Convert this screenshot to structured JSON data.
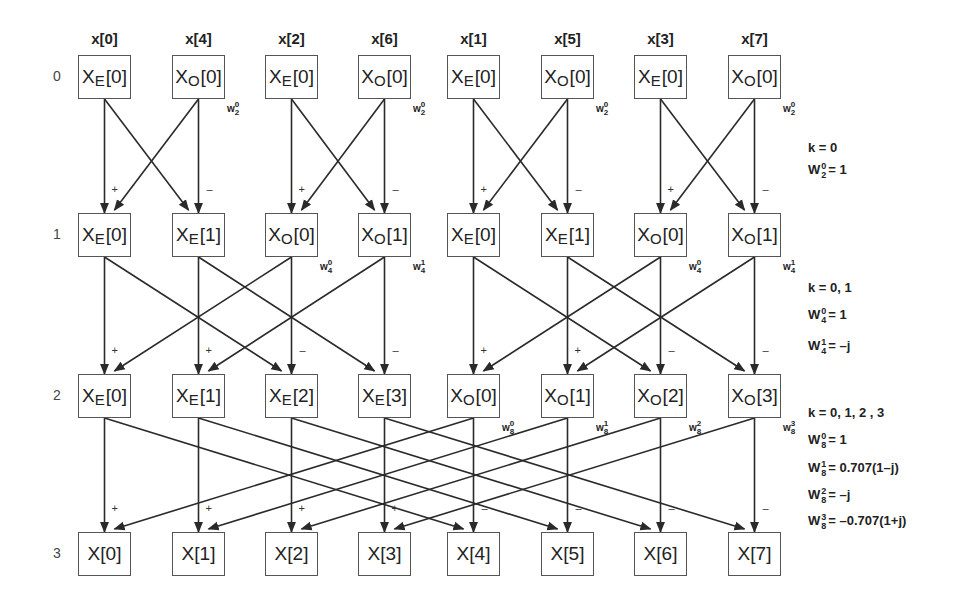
{
  "diagram": {
    "inputs": [
      "x[0]",
      "x[4]",
      "x[2]",
      "x[6]",
      "x[1]",
      "x[5]",
      "x[3]",
      "x[7]"
    ],
    "stages": [
      "0",
      "1",
      "2",
      "3"
    ],
    "rows": [
      [
        {
          "base": "X",
          "sub": "E",
          "idx": "[0]"
        },
        {
          "base": "X",
          "sub": "O",
          "idx": "[0]"
        },
        {
          "base": "X",
          "sub": "E",
          "idx": "[0]"
        },
        {
          "base": "X",
          "sub": "O",
          "idx": "[0]"
        },
        {
          "base": "X",
          "sub": "E",
          "idx": "[0]"
        },
        {
          "base": "X",
          "sub": "O",
          "idx": "[0]"
        },
        {
          "base": "X",
          "sub": "E",
          "idx": "[0]"
        },
        {
          "base": "X",
          "sub": "O",
          "idx": "[0]"
        }
      ],
      [
        {
          "base": "X",
          "sub": "E",
          "idx": "[0]"
        },
        {
          "base": "X",
          "sub": "E",
          "idx": "[1]"
        },
        {
          "base": "X",
          "sub": "O",
          "idx": "[0]"
        },
        {
          "base": "X",
          "sub": "O",
          "idx": "[1]"
        },
        {
          "base": "X",
          "sub": "E",
          "idx": "[0]"
        },
        {
          "base": "X",
          "sub": "E",
          "idx": "[1]"
        },
        {
          "base": "X",
          "sub": "O",
          "idx": "[0]"
        },
        {
          "base": "X",
          "sub": "O",
          "idx": "[1]"
        }
      ],
      [
        {
          "base": "X",
          "sub": "E",
          "idx": "[0]"
        },
        {
          "base": "X",
          "sub": "E",
          "idx": "[1]"
        },
        {
          "base": "X",
          "sub": "E",
          "idx": "[2]"
        },
        {
          "base": "X",
          "sub": "E",
          "idx": "[3]"
        },
        {
          "base": "X",
          "sub": "O",
          "idx": "[0]"
        },
        {
          "base": "X",
          "sub": "O",
          "idx": "[1]"
        },
        {
          "base": "X",
          "sub": "O",
          "idx": "[2]"
        },
        {
          "base": "X",
          "sub": "O",
          "idx": "[3]"
        }
      ],
      [
        {
          "base": "X",
          "sub": "",
          "idx": "[0]"
        },
        {
          "base": "X",
          "sub": "",
          "idx": "[1]"
        },
        {
          "base": "X",
          "sub": "",
          "idx": "[2]"
        },
        {
          "base": "X",
          "sub": "",
          "idx": "[3]"
        },
        {
          "base": "X",
          "sub": "",
          "idx": "[4]"
        },
        {
          "base": "X",
          "sub": "",
          "idx": "[5]"
        },
        {
          "base": "X",
          "sub": "",
          "idx": "[6]"
        },
        {
          "base": "X",
          "sub": "",
          "idx": "[7]"
        }
      ]
    ],
    "twiddles": [
      [
        {
          "col": 1,
          "k": "0",
          "N": "2"
        },
        {
          "col": 3,
          "k": "0",
          "N": "2"
        },
        {
          "col": 5,
          "k": "0",
          "N": "2"
        },
        {
          "col": 7,
          "k": "0",
          "N": "2"
        }
      ],
      [
        {
          "col": 2,
          "k": "0",
          "N": "4"
        },
        {
          "col": 3,
          "k": "1",
          "N": "4"
        },
        {
          "col": 6,
          "k": "0",
          "N": "4"
        },
        {
          "col": 7,
          "k": "1",
          "N": "4"
        }
      ],
      [
        {
          "col": 4,
          "k": "0",
          "N": "8"
        },
        {
          "col": 5,
          "k": "1",
          "N": "8"
        },
        {
          "col": 6,
          "k": "2",
          "N": "8"
        },
        {
          "col": 7,
          "k": "3",
          "N": "8"
        }
      ]
    ],
    "signs": {
      "plus": "+",
      "minus": "–"
    },
    "equations": [
      {
        "k_range": "k = 0",
        "terms": [
          {
            "k": "0",
            "N": "2",
            "value": "= 1"
          }
        ]
      },
      {
        "k_range": "k = 0, 1",
        "terms": [
          {
            "k": "0",
            "N": "4",
            "value": "= 1"
          },
          {
            "k": "1",
            "N": "4",
            "value": "= –j"
          }
        ]
      },
      {
        "k_range": "k = 0, 1, 2 , 3",
        "terms": [
          {
            "k": "0",
            "N": "8",
            "value": "= 1"
          },
          {
            "k": "1",
            "N": "8",
            "value": "= 0.707(1–j)"
          },
          {
            "k": "2",
            "N": "8",
            "value": "= –j"
          },
          {
            "k": "3",
            "N": "8",
            "value": "= –0.707(1+j)"
          }
        ]
      }
    ],
    "twiddle_symbol": "W",
    "colors": {
      "line": "#2a2a2a",
      "box_border": "#555555",
      "text": "#222222"
    }
  }
}
